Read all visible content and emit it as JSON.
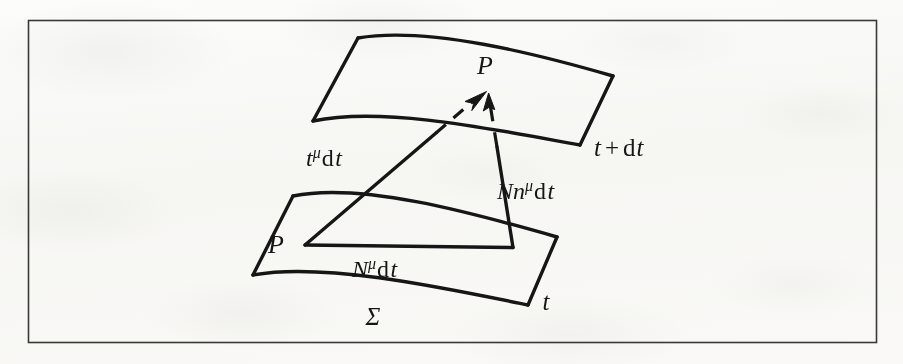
{
  "figure": {
    "name": "spacetime-foliation-diagram",
    "frame_color": "#3a3a3a",
    "ink_color": "#161616",
    "paper_color": "#fdfdfc"
  },
  "labels": {
    "point_upper": {
      "text": "P",
      "style": "italic",
      "meaning": "image of P on the later hypersurface"
    },
    "point_lower": {
      "text": "P",
      "style": "italic",
      "meaning": "point P on the initial hypersurface"
    },
    "slice_lower": {
      "text": "t",
      "style": "italic",
      "meaning": "hypersurface at coordinate time t"
    },
    "slice_upper": {
      "parts": [
        {
          "text": "t",
          "style": "italic"
        },
        {
          "text": "+",
          "style": "upright"
        },
        {
          "text": "d",
          "style": "upright"
        },
        {
          "text": "t",
          "style": "italic"
        }
      ],
      "plain": "t + d t",
      "meaning": "hypersurface at coordinate time t + dt"
    },
    "surface_sigma": {
      "text": "Σ",
      "style": "italic",
      "meaning": "spacelike hypersurface Sigma"
    },
    "vector_time": {
      "parts": [
        {
          "text": "t",
          "style": "italic"
        },
        {
          "text": "μ",
          "style": "superscript"
        },
        {
          "text": "d",
          "style": "upright"
        },
        {
          "text": "t",
          "style": "italic"
        }
      ],
      "plain": "tμ d t",
      "meaning": "time vector displacement t^mu dt"
    },
    "vector_normal": {
      "parts": [
        {
          "text": "N",
          "style": "italic"
        },
        {
          "text": "n",
          "style": "italic"
        },
        {
          "text": "μ",
          "style": "superscript"
        },
        {
          "text": "d",
          "style": "upright"
        },
        {
          "text": "t",
          "style": "italic"
        }
      ],
      "plain": "Nnμ d t",
      "meaning": "lapse times unit normal, N n^mu dt"
    },
    "vector_shift": {
      "parts": [
        {
          "text": "N",
          "style": "italic"
        },
        {
          "text": "μ",
          "style": "superscript"
        },
        {
          "text": "d",
          "style": "upright"
        },
        {
          "text": "t",
          "style": "italic"
        }
      ],
      "plain": "Nμ d t",
      "meaning": "shift vector displacement N^mu dt"
    }
  },
  "geometry": {
    "frame": {
      "x": 28,
      "y": 20,
      "width": 849,
      "height": 323
    },
    "upper_surface": {
      "corners": [
        [
          358,
          38
        ],
        [
          613,
          76
        ],
        [
          580,
          145
        ],
        [
          313,
          121
        ]
      ],
      "note": "curved quadrilateral, top and bottom edges bow upward"
    },
    "lower_surface": {
      "corners": [
        [
          293,
          196
        ],
        [
          557,
          237
        ],
        [
          528,
          305
        ],
        [
          253,
          275
        ]
      ],
      "note": "curved quadrilateral, top and bottom edges bow upward"
    },
    "point_P_upper": [
      488,
      90
    ],
    "point_P_lower": [
      305,
      245
    ],
    "shift_path": [
      [
        305,
        245
      ],
      [
        513,
        248
      ]
    ],
    "normal_path": [
      [
        513,
        248
      ],
      [
        488,
        90
      ]
    ],
    "time_path": [
      [
        305,
        245
      ],
      [
        488,
        90
      ]
    ]
  }
}
